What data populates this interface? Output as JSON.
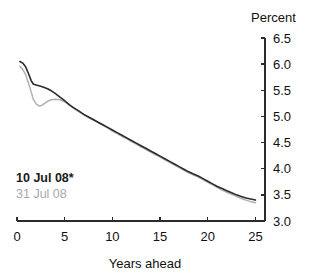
{
  "chart_data": {
    "type": "line",
    "title": "",
    "subtitle": "",
    "xlabel": "Years ahead",
    "ylabel": "Percent",
    "xlim": [
      0,
      26
    ],
    "ylim": [
      3.0,
      6.5
    ],
    "xticks": [
      0,
      5,
      10,
      15,
      20,
      25
    ],
    "xtick_labels": [
      "0",
      "5",
      "10",
      "15",
      "20",
      "25"
    ],
    "yticks": [
      3.0,
      3.5,
      4.0,
      4.5,
      5.0,
      5.5,
      6.0,
      6.5
    ],
    "ytick_labels": [
      "3.0",
      "3.5",
      "4.0",
      "4.5",
      "5.0",
      "5.5",
      "6.0",
      "6.5"
    ],
    "grid": false,
    "legend_position": "inside-lower-left",
    "axis_style": "y-axis-right",
    "series": [
      {
        "name": "10 Jul 08*",
        "color": "#2b2b2b",
        "width": 1.6,
        "x": [
          0.3,
          0.6,
          0.9,
          1.2,
          1.5,
          1.7,
          2.0,
          2.4,
          2.8,
          3.2,
          3.6,
          4.0,
          4.5,
          5.0,
          5.5,
          6.0,
          6.5,
          7.0,
          7.5,
          8.0,
          8.5,
          9.0,
          9.5,
          10.0,
          10.5,
          11.0,
          11.5,
          12.0,
          12.5,
          13.0,
          13.5,
          14.0,
          14.5,
          15.0,
          15.5,
          16.0,
          16.5,
          17.0,
          17.5,
          18.0,
          18.5,
          19.0,
          19.5,
          20.0,
          20.5,
          21.0,
          21.5,
          22.0,
          22.5,
          23.0,
          23.5,
          24.0,
          24.5,
          25.0
        ],
        "y": [
          6.05,
          6.02,
          5.95,
          5.82,
          5.68,
          5.62,
          5.6,
          5.58,
          5.56,
          5.53,
          5.49,
          5.44,
          5.37,
          5.3,
          5.22,
          5.16,
          5.1,
          5.04,
          4.99,
          4.94,
          4.89,
          4.84,
          4.79,
          4.74,
          4.69,
          4.64,
          4.59,
          4.54,
          4.49,
          4.44,
          4.39,
          4.34,
          4.29,
          4.24,
          4.19,
          4.14,
          4.09,
          4.04,
          3.99,
          3.94,
          3.9,
          3.86,
          3.81,
          3.76,
          3.71,
          3.66,
          3.62,
          3.58,
          3.54,
          3.5,
          3.47,
          3.44,
          3.42,
          3.4
        ]
      },
      {
        "name": "31 Jul 08",
        "color": "#b0b0b0",
        "width": 1.5,
        "x": [
          0.3,
          0.6,
          0.9,
          1.2,
          1.5,
          1.7,
          2.0,
          2.3,
          2.6,
          2.9,
          3.2,
          3.6,
          4.0,
          4.5,
          5.0,
          5.5,
          6.0,
          6.5,
          7.0,
          7.5,
          8.0,
          8.5,
          9.0,
          9.5,
          10.0,
          10.5,
          11.0,
          11.5,
          12.0,
          12.5,
          13.0,
          13.5,
          14.0,
          14.5,
          15.0,
          15.5,
          16.0,
          16.5,
          17.0,
          17.5,
          18.0,
          18.5,
          19.0,
          19.5,
          20.0,
          20.5,
          21.0,
          21.5,
          22.0,
          22.5,
          23.0,
          23.5,
          24.0,
          24.5,
          25.0
        ],
        "y": [
          5.96,
          5.9,
          5.8,
          5.64,
          5.46,
          5.33,
          5.24,
          5.2,
          5.21,
          5.25,
          5.29,
          5.32,
          5.33,
          5.32,
          5.28,
          5.22,
          5.15,
          5.09,
          5.03,
          4.98,
          4.93,
          4.88,
          4.83,
          4.78,
          4.72,
          4.67,
          4.62,
          4.57,
          4.52,
          4.47,
          4.42,
          4.37,
          4.32,
          4.27,
          4.22,
          4.17,
          4.12,
          4.07,
          4.02,
          3.97,
          3.92,
          3.88,
          3.84,
          3.79,
          3.74,
          3.69,
          3.64,
          3.59,
          3.55,
          3.51,
          3.47,
          3.43,
          3.4,
          3.37,
          3.35
        ]
      }
    ]
  },
  "legend": {
    "primary_label": "10 Jul 08*",
    "secondary_label": "31 Jul 08"
  },
  "colors": {
    "primary_series": "#2b2b2b",
    "secondary_series": "#b0b0b0",
    "axis": "#2b2b2b",
    "background": "#ffffff"
  }
}
